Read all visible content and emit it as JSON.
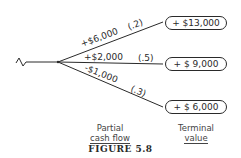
{
  "diagram": {
    "type": "decision-tree",
    "branches": [
      {
        "cash_flow": "+$6,000",
        "probability": "(.2)",
        "terminal_value": "+ $13,000"
      },
      {
        "cash_flow": "+$2,000",
        "probability": "(.5)",
        "terminal_value": "+ $ 9,000"
      },
      {
        "cash_flow": "-$1,000",
        "probability": "(.3)",
        "terminal_value": "+ $ 6,000"
      }
    ],
    "column_labels": {
      "partial_cash_flow": [
        "Partial",
        "cash flow"
      ],
      "terminal_value": [
        "Terminal",
        "value"
      ]
    },
    "caption": "FIGURE 5.8",
    "colors": {
      "ink": "#2a2a2a",
      "background": "#ffffff"
    }
  }
}
